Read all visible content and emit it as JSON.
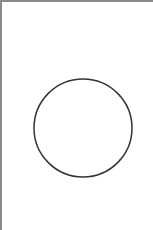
{
  "canvas": {
    "width": 153,
    "height": 230,
    "background": "#ffffff",
    "border_color": "#8a8a8a"
  },
  "shapes": [
    {
      "type": "circle",
      "cx": 81,
      "cy": 126,
      "r": 49,
      "stroke": "#333333",
      "stroke_width": 1.5,
      "fill": "none"
    }
  ]
}
